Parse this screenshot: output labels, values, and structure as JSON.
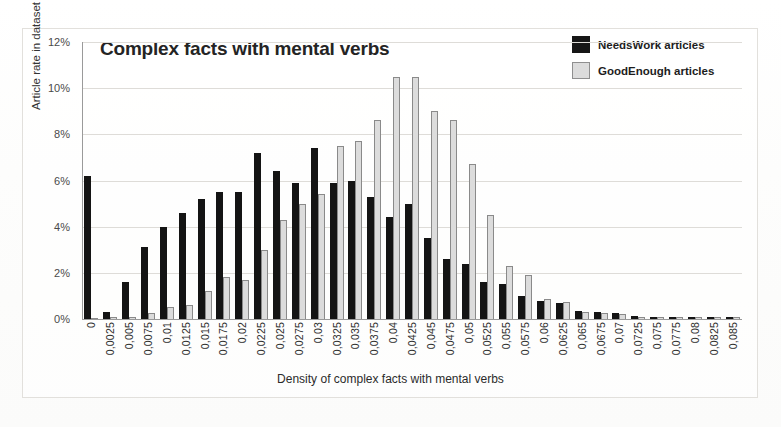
{
  "chart_data": {
    "type": "bar",
    "title": "Complex facts with mental verbs",
    "xlabel": "Density of complex facts with mental verbs",
    "ylabel": "Article rate in dataset",
    "ylim": [
      0,
      12
    ],
    "yticks": [
      "0%",
      "2%",
      "4%",
      "6%",
      "8%",
      "10%",
      "12%"
    ],
    "ytick_values": [
      0,
      2,
      4,
      6,
      8,
      10,
      12
    ],
    "grid": true,
    "legend_position": "top-right",
    "categories": [
      "0",
      "0,0025",
      "0,005",
      "0,0075",
      "0,01",
      "0,0125",
      "0,015",
      "0,0175",
      "0,02",
      "0,0225",
      "0,025",
      "0,0275",
      "0,03",
      "0,0325",
      "0,035",
      "0,0375",
      "0,04",
      "0,0425",
      "0,045",
      "0,0475",
      "0,05",
      "0,0525",
      "0,055",
      "0,0575",
      "0,06",
      "0,0625",
      "0,065",
      "0,0675",
      "0,07",
      "0,0725",
      "0,075",
      "0,0775",
      "0,08",
      "0,0825",
      "0,085"
    ],
    "series": [
      {
        "name": "NeedsWork articles",
        "color": "#141414",
        "values": [
          6.2,
          0.3,
          1.6,
          3.1,
          4.0,
          4.6,
          5.2,
          5.5,
          5.5,
          7.2,
          6.4,
          5.9,
          7.4,
          5.9,
          6.0,
          5.3,
          4.4,
          5.0,
          3.5,
          2.6,
          2.4,
          1.6,
          1.5,
          1.0,
          0.8,
          0.7,
          0.35,
          0.3,
          0.25,
          0.12,
          0.1,
          0.1,
          0.08,
          0.08,
          0.08
        ]
      },
      {
        "name": "GoodEnough articles",
        "color": "#dcdcdc",
        "values": [
          0.0,
          0.08,
          0.1,
          0.25,
          0.5,
          0.6,
          1.2,
          1.8,
          1.7,
          3.0,
          4.3,
          5.0,
          5.4,
          7.5,
          7.7,
          8.6,
          10.5,
          10.5,
          9.0,
          8.6,
          6.7,
          4.5,
          2.3,
          1.9,
          0.85,
          0.75,
          0.3,
          0.25,
          0.2,
          0.1,
          0.1,
          0.1,
          0.08,
          0.08,
          0.08
        ]
      }
    ]
  },
  "legend": {
    "items": [
      {
        "label": "NeedsWork articles",
        "swatch": "black"
      },
      {
        "label": "GoodEnough articles",
        "swatch": "gray"
      }
    ]
  },
  "background_artifacts": {
    "top_text": "",
    "mid_text": "",
    "right_text": ""
  }
}
